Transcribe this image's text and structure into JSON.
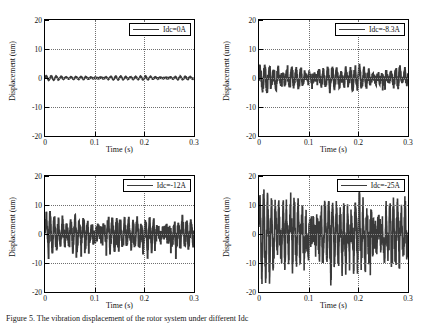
{
  "figure": {
    "caption": "Figure 5. The vibration displacement of the rotor system under different Idc"
  },
  "axes_common": {
    "xlabel": "Time (s)",
    "ylabel": "Displacement (um)",
    "xticks": [
      "0",
      "0.1",
      "0.2",
      "0.3"
    ],
    "yticks": [
      "20",
      "10",
      "0",
      "-10",
      "-20"
    ],
    "xlim": [
      0,
      0.3
    ],
    "ylim": [
      -20,
      20
    ],
    "line_color": "#3a3a3a",
    "grid_color": "#6f6f6f"
  },
  "chart_data": [
    {
      "type": "line",
      "title": "",
      "legend": "Idc=0A",
      "legend_position": "top-right",
      "xlabel": "Time (s)",
      "ylabel": "Displacement (um)",
      "xlim": [
        0,
        0.3
      ],
      "ylim": [
        -20,
        20
      ],
      "xticks": [
        0,
        0.1,
        0.2,
        0.3
      ],
      "yticks": [
        -20,
        -10,
        0,
        10,
        20
      ],
      "grid": true,
      "amplitude_um": 0.8,
      "series": [
        {
          "name": "Idc=0A",
          "description": "near-flat low-amplitude periodic ripple about zero",
          "envelope_um": [
            -1.0,
            1.0
          ],
          "ripple_frequency_hz": 100
        }
      ]
    },
    {
      "type": "line",
      "title": "",
      "legend": "Idc=-8.3A",
      "legend_position": "top-right",
      "xlabel": "Time (s)",
      "ylabel": "Displacement (um)",
      "xlim": [
        0,
        0.3
      ],
      "ylim": [
        -20,
        20
      ],
      "xticks": [
        0,
        0.1,
        0.2,
        0.3
      ],
      "yticks": [
        -20,
        -10,
        0,
        10,
        20
      ],
      "grid": true,
      "amplitude_um": 4.5,
      "series": [
        {
          "name": "Idc=-8.3A",
          "description": "dense quasi-periodic oscillation about zero",
          "envelope_um": [
            -6.0,
            5.0
          ],
          "ripple_frequency_hz": 110
        }
      ]
    },
    {
      "type": "line",
      "title": "",
      "legend": "Idc=-12A",
      "legend_position": "top-right",
      "xlabel": "Time (s)",
      "ylabel": "Displacement (um)",
      "xlim": [
        0,
        0.3
      ],
      "ylim": [
        -20,
        20
      ],
      "xticks": [
        0,
        0.1,
        0.2,
        0.3
      ],
      "yticks": [
        -20,
        -10,
        0,
        10,
        20
      ],
      "grid": true,
      "amplitude_um": 7.0,
      "series": [
        {
          "name": "Idc=-12A",
          "description": "irregular oscillation with peaks near plus/minus 8 um",
          "envelope_um": [
            -9.0,
            8.0
          ],
          "ripple_frequency_hz": 120
        }
      ]
    },
    {
      "type": "line",
      "title": "",
      "legend": "Idc=-25A",
      "legend_position": "top-right",
      "xlabel": "Time (s)",
      "ylabel": "Displacement (um)",
      "xlim": [
        0,
        0.3
      ],
      "ylim": [
        -20,
        20
      ],
      "xticks": [
        0,
        0.1,
        0.2,
        0.3
      ],
      "yticks": [
        -20,
        -10,
        0,
        10,
        20
      ],
      "grid": true,
      "amplitude_um": 15.0,
      "series": [
        {
          "name": "Idc=-25A",
          "description": "large chaotic oscillation reaching plus/minus 18 um",
          "envelope_um": [
            -19.0,
            17.0
          ],
          "ripple_frequency_hz": 130
        }
      ]
    }
  ]
}
